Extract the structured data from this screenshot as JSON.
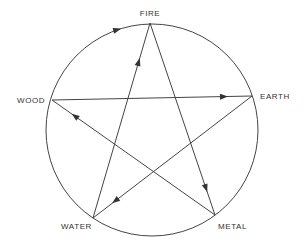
{
  "diagram": {
    "colors": {
      "line": "#444444",
      "text": "#333333",
      "background": "#ffffff"
    },
    "nodes": [
      {
        "id": "fire",
        "label": "FIRE"
      },
      {
        "id": "earth",
        "label": "EARTH"
      },
      {
        "id": "metal",
        "label": "METAL"
      },
      {
        "id": "water",
        "label": "WATER"
      },
      {
        "id": "wood",
        "label": "WOOD"
      }
    ],
    "generating_cycle_arcs": [
      {
        "from": "wood",
        "to": "fire",
        "arrow": true
      },
      {
        "from": "fire",
        "to": "earth",
        "arrow": false
      },
      {
        "from": "earth",
        "to": "metal",
        "arrow": false
      },
      {
        "from": "metal",
        "to": "water",
        "arrow": false
      },
      {
        "from": "water",
        "to": "wood",
        "arrow": false
      }
    ],
    "controlling_cycle_lines": [
      {
        "from": "water",
        "to": "fire"
      },
      {
        "from": "fire",
        "to": "metal"
      },
      {
        "from": "metal",
        "to": "wood"
      },
      {
        "from": "wood",
        "to": "earth"
      },
      {
        "from": "earth",
        "to": "water"
      }
    ]
  }
}
